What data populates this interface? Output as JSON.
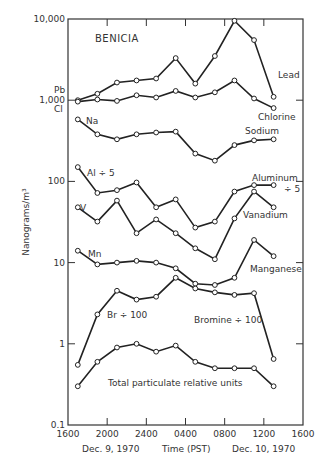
{
  "chart_data": {
    "type": "line",
    "title": "BENICIA",
    "xlabel": "Time (PST)",
    "xlabel_left": "Dec. 9, 1970",
    "xlabel_right": "Dec. 10, 1970",
    "ylabel": "Nanograms/m³",
    "yscale": "log",
    "ylim": [
      0.1,
      10000
    ],
    "y_ticks": [
      "0.1",
      "1",
      "10",
      "100",
      "1,000",
      "10,000"
    ],
    "x_ticks": [
      "1600",
      "2000",
      "2400",
      "0400",
      "0800",
      "1200",
      "1600"
    ],
    "x": [
      "1700",
      "1900",
      "2100",
      "2300",
      "0100",
      "0300",
      "0500",
      "0700",
      "0900",
      "1100",
      "1300"
    ],
    "grid": false,
    "series": [
      {
        "name": "Lead",
        "left_label": "Pb",
        "right_label": "Lead",
        "values": [
          1000,
          1200,
          1650,
          1750,
          1850,
          3300,
          1600,
          3500,
          9500,
          5500,
          1100
        ]
      },
      {
        "name": "Chlorine",
        "left_label": "Cl",
        "right_label": "Chlorine",
        "values": [
          960,
          1020,
          980,
          1150,
          1080,
          1300,
          1080,
          1250,
          1750,
          1050,
          800
        ]
      },
      {
        "name": "Sodium",
        "left_label": "Na",
        "right_label": "Sodium",
        "values": [
          580,
          380,
          330,
          380,
          400,
          410,
          220,
          180,
          280,
          320,
          330
        ]
      },
      {
        "name": "Aluminum ÷ 5",
        "left_label": "Al ÷ 5",
        "right_label": "Aluminum ÷ 5",
        "values": [
          150,
          72,
          78,
          97,
          48,
          60,
          27,
          32,
          75,
          90,
          90
        ]
      },
      {
        "name": "Vanadium",
        "left_label": "V",
        "right_label": "Vanadium",
        "values": [
          48,
          32,
          58,
          23,
          34,
          23,
          15,
          11,
          35,
          75,
          48
        ]
      },
      {
        "name": "Manganese",
        "left_label": "Mn",
        "right_label": "Manganese",
        "values": [
          14,
          9.5,
          10,
          10.5,
          10,
          8.5,
          5.5,
          5.3,
          6.5,
          19,
          12
        ]
      },
      {
        "name": "Bromine ÷ 100",
        "left_label": "Br ÷ 100",
        "right_label": "Bromine ÷ 100",
        "values": [
          0.55,
          2.3,
          4.5,
          3.5,
          3.8,
          6.5,
          4.8,
          4.3,
          4.0,
          4.2,
          0.65
        ]
      },
      {
        "name": "Total particulate relative units",
        "left_label": "",
        "right_label": "Total particulate relative units",
        "values": [
          0.3,
          0.6,
          0.9,
          1.0,
          0.8,
          0.95,
          0.6,
          0.5,
          0.5,
          0.5,
          0.3
        ]
      }
    ]
  }
}
